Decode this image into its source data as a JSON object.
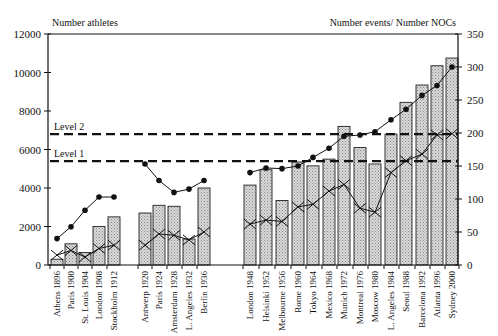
{
  "chart_data": {
    "type": "bar",
    "title": "",
    "ylabel_left": "Number athletes",
    "ylabel_right": "Number events/ Number NOCs",
    "ylim_left": [
      0,
      12000
    ],
    "ylim_right": [
      0,
      350
    ],
    "yticks_left": [
      0,
      2000,
      4000,
      6000,
      8000,
      10000,
      12000
    ],
    "yticks_right": [
      0,
      50,
      100,
      150,
      200,
      250,
      300,
      350
    ],
    "grid": false,
    "groups": [
      {
        "name": "pre-WWI",
        "categories": [
          "Athens 1896",
          "Paris 1900",
          "St. Louis 1904",
          "London 1908",
          "Stockholm 1912"
        ]
      },
      {
        "name": "inter-war",
        "categories": [
          "Antwerp 1920",
          "Paris 1924",
          "Amsterdam 1928",
          "L. Angeles 1932",
          "Berlin 1936"
        ]
      },
      {
        "name": "post-war",
        "categories": [
          "London 1948",
          "Helsinki 1952",
          "Melbourne 1956",
          "Rome 1960",
          "Tokyo 1964",
          "Mexico 1968",
          "Munich 1972",
          "Montreal 1976",
          "Moscow 1980",
          "L. Angeles 1984",
          "Seoul 1988",
          "Barcelona 1992",
          "Atlanta 1996",
          "Sydney 2000"
        ]
      }
    ],
    "categories": [
      "Athens 1896",
      "Paris 1900",
      "St. Louis 1904",
      "London 1908",
      "Stockholm 1912",
      "Antwerp 1920",
      "Paris 1924",
      "Amsterdam 1928",
      "L. Angeles 1932",
      "Berlin 1936",
      "London 1948",
      "Helsinki 1952",
      "Melbourne 1956",
      "Rome 1960",
      "Tokyo 1964",
      "Mexico 1968",
      "Munich 1972",
      "Montreal 1976",
      "Moscow 1980",
      "L. Angeles 1984",
      "Seoul 1988",
      "Barcelona 1992",
      "Atlanta 1996",
      "Sydney 2000"
    ],
    "series": [
      {
        "name": "Number athletes",
        "type": "bar",
        "axis": "left",
        "values": [
          300,
          1100,
          650,
          2000,
          2500,
          2700,
          3100,
          3050,
          1350,
          4000,
          4150,
          4950,
          3350,
          5350,
          5150,
          5500,
          7200,
          6100,
          5250,
          6800,
          8450,
          9350,
          10350,
          10750
        ]
      },
      {
        "name": "Number events",
        "type": "line",
        "marker": "x",
        "axis": "right",
        "values": [
          15,
          22,
          12,
          25,
          30,
          30,
          47,
          45,
          38,
          50,
          62,
          68,
          66,
          88,
          92,
          112,
          122,
          86,
          80,
          140,
          158,
          168,
          197,
          199
        ]
      },
      {
        "name": "Number NOCs",
        "type": "line",
        "marker": "dot",
        "axis": "right",
        "values": [
          40,
          58,
          83,
          103,
          103,
          153,
          128,
          110,
          115,
          128,
          140,
          147,
          146,
          150,
          163,
          177,
          195,
          197,
          202,
          220,
          236,
          257,
          272,
          300
        ]
      }
    ],
    "annotations": [
      {
        "label": "Level 2",
        "type": "hline",
        "axis": "left",
        "value": 6800
      },
      {
        "label": "Level 1",
        "type": "hline",
        "axis": "left",
        "value": 5400
      }
    ]
  }
}
